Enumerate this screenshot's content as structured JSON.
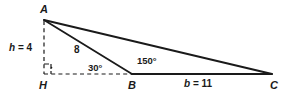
{
  "figure": {
    "type": "triangle-with-altitude",
    "vertices": [
      {
        "id": "A",
        "label": "A",
        "x": 44,
        "y": 20
      },
      {
        "id": "H",
        "label": "H",
        "x": 44,
        "y": 74
      },
      {
        "id": "B",
        "label": "B",
        "x": 132,
        "y": 74
      },
      {
        "id": "C",
        "label": "C",
        "x": 272,
        "y": 74
      }
    ],
    "labels": {
      "vertex_a": "A",
      "vertex_h": "H",
      "vertex_b": "B",
      "vertex_c": "C",
      "height": {
        "var": "h",
        "eq": " = ",
        "value": "4",
        "full": "h = 4"
      },
      "side_ab": "8",
      "side_b": {
        "var": "b",
        "eq": " = ",
        "value": "11",
        "full": "b = 11"
      },
      "angle_abh": "30°",
      "angle_abc": "150°"
    },
    "segments": [
      {
        "name": "segment-a-b",
        "from": "A",
        "to": "B",
        "style": "solid"
      },
      {
        "name": "segment-a-c",
        "from": "A",
        "to": "C",
        "style": "solid"
      },
      {
        "name": "segment-b-c",
        "from": "B",
        "to": "C",
        "style": "solid"
      },
      {
        "name": "segment-a-h",
        "from": "A",
        "to": "H",
        "style": "dashed"
      },
      {
        "name": "segment-h-b",
        "from": "H",
        "to": "B",
        "style": "dashed"
      }
    ],
    "markers": [
      {
        "name": "right-angle-marker",
        "at": "H",
        "type": "square-with-dot"
      }
    ],
    "colors": {
      "stroke": "#1a1a1a",
      "text": "#1a1a1a",
      "background": "#ffffff"
    }
  }
}
